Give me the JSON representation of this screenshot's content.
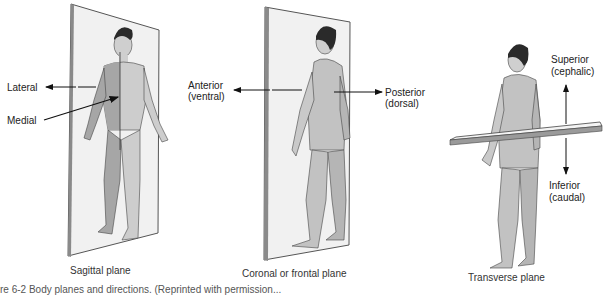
{
  "figure": {
    "caption": "re 6-2 Body planes and directions. (Reprinted with permission...",
    "panels": [
      {
        "name": "sagittal",
        "title": "Sagittal plane",
        "labels": {
          "lateral": "Lateral",
          "medial": "Medial"
        }
      },
      {
        "name": "coronal",
        "title": "Coronal or frontal plane",
        "labels": {
          "anterior": "Anterior",
          "anterior_alt": "(ventral)",
          "posterior": "Posterior",
          "posterior_alt": "(dorsal)"
        }
      },
      {
        "name": "transverse",
        "title": "Transverse plane",
        "labels": {
          "superior": "Superior",
          "superior_alt": "(cephalic)",
          "inferior": "Inferior",
          "inferior_alt": "(caudal)"
        }
      }
    ]
  },
  "colors": {
    "plane_fill": "#f1f1f1",
    "plane_edge": "#555555",
    "body_fill": "#c9c9c9",
    "body_shadow": "#9e9e9e",
    "hair": "#2a2a2a",
    "arrow": "#111111"
  }
}
